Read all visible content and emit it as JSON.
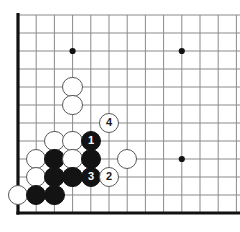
{
  "diagram": {
    "kind": "go-board-diagram",
    "board": {
      "width_px": 240,
      "height_px": 232,
      "origin_x": 18,
      "origin_y": 15,
      "spacing_x": 18.2,
      "spacing_y": 18.0,
      "cols": 13,
      "rows": 12,
      "line_color": "#8a8a8a",
      "edge_color": "#111111",
      "edge_width": 3.2,
      "line_width": 1.0,
      "background": "#ffffff"
    },
    "star_points": [
      {
        "col": 3,
        "row": 2
      },
      {
        "col": 9,
        "row": 2
      },
      {
        "col": 9,
        "row": 8
      }
    ],
    "stone_radius": 10.2,
    "stones": [
      {
        "id": "w-d10",
        "color": "white",
        "col": 3,
        "row": 4,
        "label": ""
      },
      {
        "id": "w-d9",
        "color": "white",
        "col": 3,
        "row": 5,
        "label": ""
      },
      {
        "id": "w-f8",
        "color": "white",
        "col": 5,
        "row": 6,
        "label": "4"
      },
      {
        "id": "w-c7",
        "color": "white",
        "col": 2,
        "row": 7,
        "label": ""
      },
      {
        "id": "w-d7",
        "color": "white",
        "col": 3,
        "row": 7,
        "label": ""
      },
      {
        "id": "b-e7",
        "color": "black",
        "col": 4,
        "row": 7,
        "label": "1"
      },
      {
        "id": "w-b6",
        "color": "white",
        "col": 1,
        "row": 8,
        "label": ""
      },
      {
        "id": "b-c6",
        "color": "black",
        "col": 2,
        "row": 8,
        "label": ""
      },
      {
        "id": "w-d6",
        "color": "white",
        "col": 3,
        "row": 8,
        "label": ""
      },
      {
        "id": "b-e6",
        "color": "black",
        "col": 4,
        "row": 8,
        "label": ""
      },
      {
        "id": "w-g6",
        "color": "white",
        "col": 6,
        "row": 8,
        "label": ""
      },
      {
        "id": "w-b5",
        "color": "white",
        "col": 1,
        "row": 9,
        "label": ""
      },
      {
        "id": "b-c5",
        "color": "black",
        "col": 2,
        "row": 9,
        "label": ""
      },
      {
        "id": "b-d5",
        "color": "black",
        "col": 3,
        "row": 9,
        "label": ""
      },
      {
        "id": "b-e5",
        "color": "black",
        "col": 4,
        "row": 9,
        "label": "3"
      },
      {
        "id": "w-f5",
        "color": "white",
        "col": 5,
        "row": 9,
        "label": "2"
      },
      {
        "id": "w-a4",
        "color": "white",
        "col": 0,
        "row": 10,
        "label": ""
      },
      {
        "id": "b-b4",
        "color": "black",
        "col": 1,
        "row": 10,
        "label": ""
      },
      {
        "id": "b-c4",
        "color": "black",
        "col": 2,
        "row": 10,
        "label": ""
      }
    ],
    "move_sequence": [
      {
        "number": "1",
        "color": "black"
      },
      {
        "number": "2",
        "color": "white"
      },
      {
        "number": "3",
        "color": "black"
      },
      {
        "number": "4",
        "color": "white"
      }
    ]
  }
}
